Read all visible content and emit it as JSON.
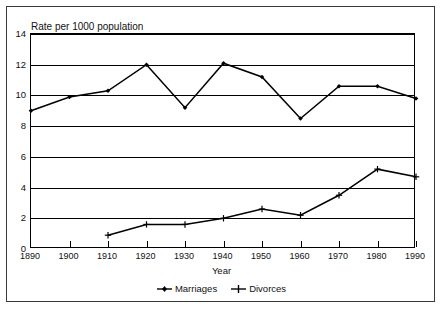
{
  "chart_data": {
    "type": "line",
    "title": "Rate per 1000 population",
    "xlabel": "Year",
    "ylabel": "",
    "categories": [
      1890,
      1900,
      1910,
      1920,
      1930,
      1940,
      1950,
      1960,
      1970,
      1980,
      1990
    ],
    "xlim": [
      1890,
      1990
    ],
    "ylim": [
      0,
      14
    ],
    "yticks": [
      0,
      2,
      4,
      6,
      8,
      10,
      12,
      14
    ],
    "xticks": [
      "1890",
      "1900",
      "1910",
      "1920",
      "1930",
      "1940",
      "1950",
      "1960",
      "1970",
      "1980",
      "1990"
    ],
    "grid": "horizontal",
    "legend_position": "bottom",
    "series": [
      {
        "name": "Marriages",
        "marker": "filled-diamond",
        "x": [
          1890,
          1900,
          1910,
          1920,
          1930,
          1940,
          1950,
          1960,
          1970,
          1980,
          1990
        ],
        "values": [
          9.0,
          9.9,
          10.3,
          12.0,
          9.2,
          12.1,
          11.2,
          8.5,
          10.6,
          10.6,
          9.8
        ]
      },
      {
        "name": "Divorces",
        "marker": "plus",
        "x": [
          1910,
          1920,
          1930,
          1940,
          1950,
          1960,
          1970,
          1980,
          1990
        ],
        "values": [
          0.9,
          1.6,
          1.6,
          2.0,
          2.6,
          2.2,
          3.5,
          5.2,
          4.7
        ]
      }
    ]
  },
  "legend": {
    "items": [
      {
        "label": "Marriages"
      },
      {
        "label": "Divorces"
      }
    ]
  },
  "colors": {
    "line": "#000000",
    "grid": "#000000",
    "frame": "#3a3a3a",
    "background": "#ffffff",
    "text": "#111111"
  }
}
